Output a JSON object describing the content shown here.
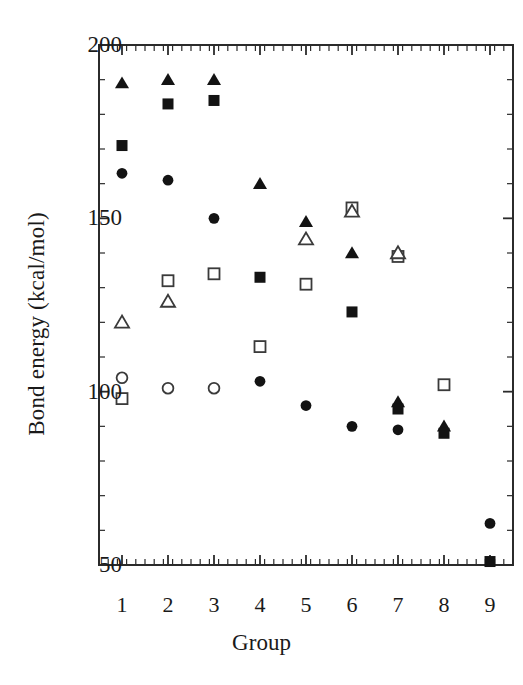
{
  "chart_data": {
    "type": "scatter",
    "title": "",
    "xlabel": "Group",
    "ylabel": "Bond energy (kcal/mol)",
    "xlim": [
      0.5,
      9.5
    ],
    "ylim": [
      50,
      200
    ],
    "xticks": [
      "1",
      "2",
      "3",
      "4",
      "5",
      "6",
      "7",
      "8",
      "9"
    ],
    "yticks": [
      "200",
      "150",
      "100",
      "50"
    ],
    "ytick_values": [
      200,
      150,
      100,
      50
    ],
    "y_minor_step": 10,
    "x_minor_step": 0.2,
    "grid": false,
    "legend": "none",
    "legend_position": "none",
    "frame": "box",
    "categories": [
      1,
      2,
      3,
      4,
      5,
      6,
      7,
      8,
      9
    ],
    "series": [
      {
        "name": "filled-triangle",
        "marker": "triangle",
        "fill": "filled",
        "color": "#131313",
        "points": [
          {
            "x": 1,
            "y": 189
          },
          {
            "x": 2,
            "y": 190
          },
          {
            "x": 3,
            "y": 190
          },
          {
            "x": 4,
            "y": 160
          },
          {
            "x": 5,
            "y": 149
          },
          {
            "x": 6,
            "y": 140
          },
          {
            "x": 7,
            "y": 97
          },
          {
            "x": 8,
            "y": 90
          }
        ]
      },
      {
        "name": "filled-square",
        "marker": "square",
        "fill": "filled",
        "color": "#131313",
        "points": [
          {
            "x": 1,
            "y": 171
          },
          {
            "x": 2,
            "y": 183
          },
          {
            "x": 3,
            "y": 184
          },
          {
            "x": 4,
            "y": 133
          },
          {
            "x": 6,
            "y": 123
          },
          {
            "x": 7,
            "y": 95
          },
          {
            "x": 8,
            "y": 88
          },
          {
            "x": 9,
            "y": 51
          }
        ]
      },
      {
        "name": "filled-circle",
        "marker": "circle",
        "fill": "filled",
        "color": "#131313",
        "points": [
          {
            "x": 1,
            "y": 163
          },
          {
            "x": 2,
            "y": 161
          },
          {
            "x": 3,
            "y": 150
          },
          {
            "x": 4,
            "y": 103
          },
          {
            "x": 5,
            "y": 96
          },
          {
            "x": 6,
            "y": 90
          },
          {
            "x": 7,
            "y": 89
          },
          {
            "x": 9,
            "y": 62
          }
        ]
      },
      {
        "name": "open-square",
        "marker": "square",
        "fill": "open",
        "color": "#3a3a3a",
        "points": [
          {
            "x": 1,
            "y": 98
          },
          {
            "x": 2,
            "y": 132
          },
          {
            "x": 3,
            "y": 134
          },
          {
            "x": 4,
            "y": 113
          },
          {
            "x": 5,
            "y": 131
          },
          {
            "x": 6,
            "y": 153
          },
          {
            "x": 7,
            "y": 139
          },
          {
            "x": 8,
            "y": 102
          }
        ]
      },
      {
        "name": "open-triangle",
        "marker": "triangle",
        "fill": "open",
        "color": "#3a3a3a",
        "points": [
          {
            "x": 1,
            "y": 120
          },
          {
            "x": 2,
            "y": 126
          },
          {
            "x": 5,
            "y": 144
          },
          {
            "x": 6,
            "y": 152
          },
          {
            "x": 7,
            "y": 140
          }
        ]
      },
      {
        "name": "open-circle",
        "marker": "circle",
        "fill": "open",
        "color": "#3a3a3a",
        "points": [
          {
            "x": 1,
            "y": 104
          },
          {
            "x": 2,
            "y": 101
          },
          {
            "x": 3,
            "y": 101
          }
        ]
      }
    ]
  }
}
